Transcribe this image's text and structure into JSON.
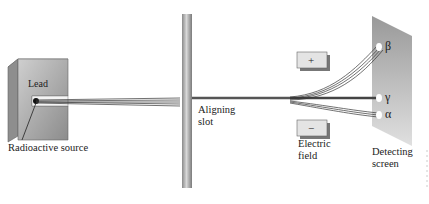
{
  "diagram": {
    "labels": {
      "lead": "Lead",
      "source": "Radioactive source",
      "slot_line1": "Aligning",
      "slot_line2": "slot",
      "field_line1": "Electric",
      "field_line2": "field",
      "screen_line1": "Detecting",
      "screen_line2": "screen",
      "plus": "+",
      "minus": "−",
      "beta": "β",
      "gamma": "γ",
      "alpha": "α"
    },
    "colors": {
      "lead": "#a8a8a8",
      "pole": "#9a9a9a",
      "screen": "#b8b8b8",
      "plate": "#e4e4e4",
      "beam": "#333333"
    }
  }
}
